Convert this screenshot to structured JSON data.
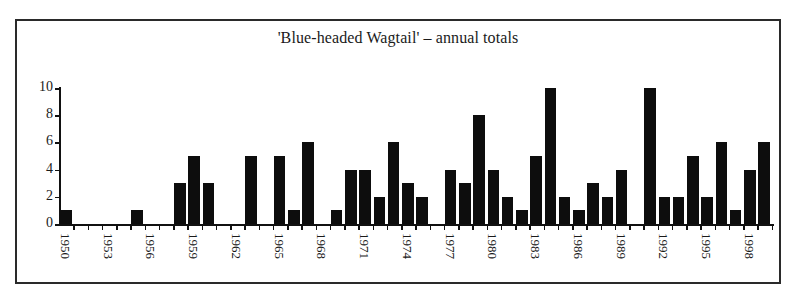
{
  "chart_data": {
    "type": "bar",
    "title": "'Blue-headed Wagtail' – annual totals",
    "xlabel": "",
    "ylabel": "",
    "ylim": [
      0,
      10
    ],
    "yticks": [
      0,
      2,
      4,
      6,
      8,
      10
    ],
    "xtick_labels": [
      "1950",
      "1953",
      "1956",
      "1959",
      "1962",
      "1965",
      "1968",
      "1971",
      "1974",
      "1977",
      "1980",
      "1983",
      "1986",
      "1989",
      "1992",
      "1995",
      "1998"
    ],
    "grid": false,
    "legend": null,
    "categories": [
      1950,
      1951,
      1952,
      1953,
      1954,
      1955,
      1956,
      1957,
      1958,
      1959,
      1960,
      1961,
      1962,
      1963,
      1964,
      1965,
      1966,
      1967,
      1968,
      1969,
      1970,
      1971,
      1972,
      1973,
      1974,
      1975,
      1976,
      1977,
      1978,
      1979,
      1980,
      1981,
      1982,
      1983,
      1984,
      1985,
      1986,
      1987,
      1988,
      1989,
      1990,
      1991,
      1992,
      1993,
      1994,
      1995,
      1996,
      1997,
      1998,
      1999
    ],
    "values": [
      1,
      0,
      0,
      0,
      0,
      1,
      0,
      0,
      3,
      5,
      3,
      0,
      0,
      5,
      0,
      5,
      1,
      6,
      0,
      1,
      4,
      4,
      2,
      6,
      3,
      2,
      0,
      4,
      3,
      8,
      4,
      2,
      1,
      5,
      10,
      2,
      1,
      3,
      2,
      4,
      0,
      10,
      2,
      2,
      5,
      2,
      6,
      1,
      4,
      6
    ]
  },
  "colors": {
    "bar": "#0d0d0d",
    "axis": "#111111",
    "frame": "#2a2a2a",
    "background": "#ffffff"
  }
}
